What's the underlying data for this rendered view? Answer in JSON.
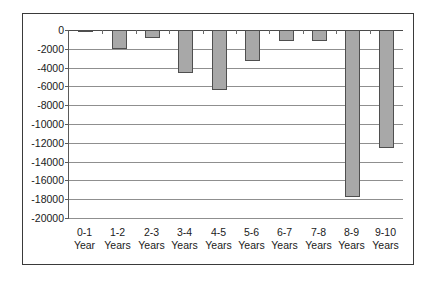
{
  "chart_data": {
    "type": "bar",
    "title": "",
    "subtitle": "",
    "xlabel": "",
    "ylabel": "",
    "categories": [
      "0-1 Year",
      "1-2 Years",
      "2-3 Years",
      "3-4 Years",
      "4-5 Years",
      "5-6 Years",
      "6-7 Years",
      "7-8 Years",
      "8-9 Years",
      "9-10 Years"
    ],
    "category_lines": [
      [
        "0-1",
        "Year"
      ],
      [
        "1-2",
        "Years"
      ],
      [
        "2-3",
        "Years"
      ],
      [
        "3-4",
        "Years"
      ],
      [
        "4-5",
        "Years"
      ],
      [
        "5-6",
        "Years"
      ],
      [
        "6-7",
        "Years"
      ],
      [
        "7-8",
        "Years"
      ],
      [
        "8-9",
        "Years"
      ],
      [
        "9-10",
        "Years"
      ]
    ],
    "values": [
      -150,
      -2000,
      -800,
      -4550,
      -6350,
      -3250,
      -1150,
      -1150,
      -17800,
      -12500
    ],
    "ylim": [
      -20000,
      0
    ],
    "ytick_values": [
      0,
      -2000,
      -4000,
      -6000,
      -8000,
      -10000,
      -12000,
      -14000,
      -16000,
      -18000,
      -20000
    ],
    "ytick_labels": [
      "0",
      "-2000",
      "-4000",
      "-6000",
      "-8000",
      "-10000",
      "-12000",
      "-14000",
      "-16000",
      "-18000",
      "-20000"
    ],
    "grid": true,
    "legend": false,
    "legend_position": "none",
    "series": [
      {
        "name": "",
        "values": [
          -150,
          -2000,
          -800,
          -4550,
          -6350,
          -3250,
          -1150,
          -1150,
          -17800,
          -12500
        ],
        "color": "#a8a8a8",
        "border_color": "#4f4f4f"
      }
    ],
    "colors": {
      "bar_fill": "#a8a8a8",
      "bar_border": "#4f4f4f",
      "gridline": "#8f8f8f",
      "axis": "#5a5a5a",
      "frame": "#3a3a3a",
      "background": "#ffffff",
      "text": "#1a1a1a"
    }
  }
}
